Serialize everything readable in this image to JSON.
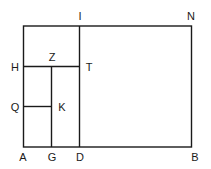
{
  "diagram": {
    "type": "geometric-rectangle-subdivision",
    "points": {
      "A": {
        "label": "A",
        "x": 23,
        "y": 147
      },
      "G": {
        "label": "G",
        "x": 52,
        "y": 147
      },
      "D": {
        "label": "D",
        "x": 80,
        "y": 147
      },
      "B": {
        "label": "B",
        "x": 191,
        "y": 147
      },
      "I": {
        "label": "I",
        "x": 80,
        "y": 26
      },
      "N": {
        "label": "N",
        "x": 191,
        "y": 26
      },
      "H": {
        "label": "H",
        "x": 23,
        "y": 67
      },
      "Z": {
        "label": "Z",
        "x": 52,
        "y": 67
      },
      "T": {
        "label": "T",
        "x": 80,
        "y": 67
      },
      "Q": {
        "label": "Q",
        "x": 23,
        "y": 107
      },
      "K": {
        "label": "K",
        "x": 52,
        "y": 107
      }
    },
    "segments": [
      [
        "A",
        "B"
      ],
      [
        "B",
        "N"
      ],
      [
        "N",
        "A_top"
      ],
      [
        "A",
        "A_top"
      ],
      [
        "I",
        "D"
      ],
      [
        "H",
        "T"
      ],
      [
        "Z",
        "G"
      ],
      [
        "Q",
        "K"
      ]
    ],
    "labels": {
      "A": "A",
      "G": "G",
      "D": "D",
      "B": "B",
      "I": "I",
      "N": "N",
      "H": "H",
      "Z": "Z",
      "T": "T",
      "Q": "Q",
      "K": "K"
    },
    "line_color": "#1a1a1a",
    "background": "#ffffff"
  }
}
